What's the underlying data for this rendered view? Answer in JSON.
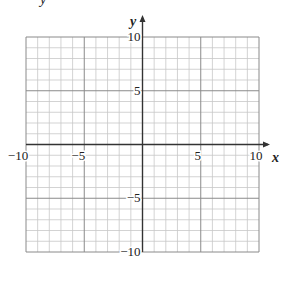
{
  "chart_data": {
    "type": "scatter",
    "title": "",
    "partial_top_text": "y",
    "xlabel": "x",
    "ylabel": "y",
    "xlim": [
      -10,
      10
    ],
    "ylim": [
      -10,
      10
    ],
    "grid": true,
    "grid_step": 1,
    "major_grid_step": 5,
    "x_ticks": [
      -10,
      -5,
      5,
      10
    ],
    "y_ticks": [
      10,
      5,
      -5,
      -10
    ],
    "x_tick_labels": [
      "−10",
      "−5",
      "5",
      "10"
    ],
    "y_tick_labels": [
      "10",
      "5",
      "−5",
      "−10"
    ],
    "series": []
  },
  "colors": {
    "minor_grid": "#c8c8c8",
    "major_grid": "#8a8a8a",
    "axis": "#333333"
  }
}
